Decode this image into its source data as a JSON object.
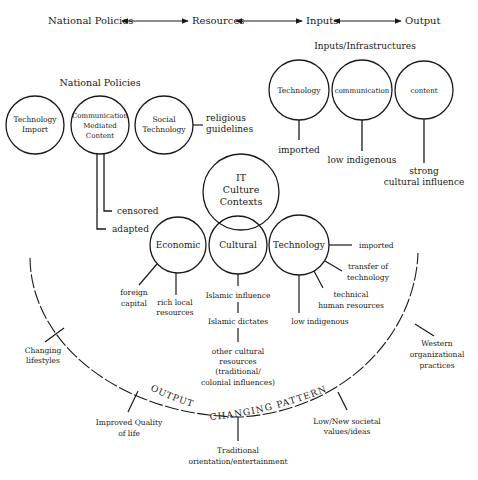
{
  "flow_header": {
    "items": [
      "National Policies",
      "Resources",
      "Inputs",
      "Output"
    ]
  },
  "national_policies": {
    "title": "National Policies",
    "circles": [
      {
        "lines": [
          "Technology",
          "Import"
        ]
      },
      {
        "lines": [
          "Communication",
          "Mediated",
          "Content"
        ]
      },
      {
        "lines": [
          "Social",
          "Technology"
        ]
      }
    ],
    "social_tech_link": [
      "religious",
      "guidelines"
    ],
    "cmc_branches": [
      "censored",
      "adapted"
    ]
  },
  "inputs": {
    "title": "Inputs/Infrastructures",
    "circles": [
      {
        "label": "Technology",
        "note": [
          "imported"
        ]
      },
      {
        "label": "communication",
        "note": [
          "low indigenous"
        ]
      },
      {
        "label": "content",
        "note": [
          "strong",
          "cultural influence"
        ]
      }
    ]
  },
  "resources": {
    "center": {
      "lines": [
        "IT",
        "Culture",
        "Contexts"
      ]
    },
    "economic": {
      "label": "Economic",
      "branches": [
        [
          "foreign",
          "capital"
        ],
        [
          "rich local",
          "resources"
        ]
      ]
    },
    "cultural": {
      "label": "Cultural",
      "chain": [
        [
          "Islamic influence"
        ],
        [
          "Islamic dictates"
        ],
        [
          "other cultural",
          "resources",
          "(traditional/",
          "colonial influences)"
        ]
      ]
    },
    "technology": {
      "label": "Technology",
      "branches": [
        [
          "imported"
        ],
        [
          "transfer of",
          "technology"
        ],
        [
          "technical",
          "human resources"
        ],
        [
          "low indigenous"
        ]
      ]
    }
  },
  "output": {
    "arc_label_left": "OUTPUT",
    "arc_label_right": "CHANGING PATTERNS",
    "items": [
      [
        "Changing",
        "lifestyles"
      ],
      [
        "Improved Quality",
        "of life"
      ],
      [
        "Traditional",
        "orientation/entertainment"
      ],
      [
        "Low/New societal",
        "values/ideas"
      ],
      [
        "Western",
        "organizational",
        "practices"
      ]
    ]
  }
}
